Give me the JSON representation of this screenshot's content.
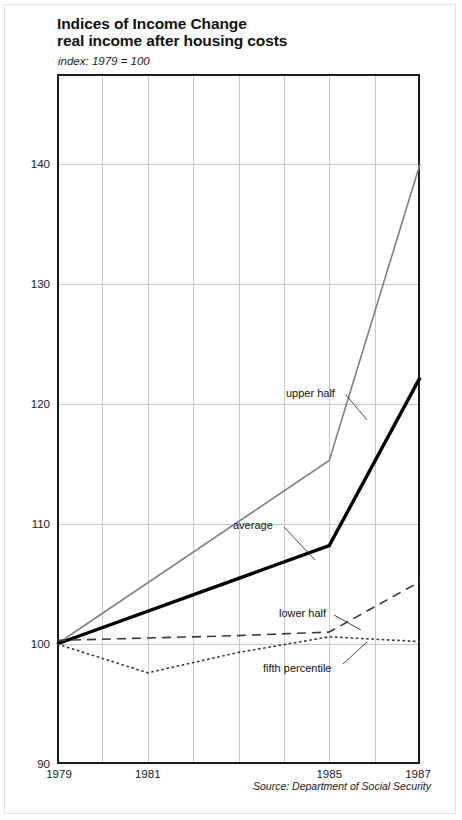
{
  "header": {
    "title_line1": "Indices of Income Change",
    "title_line2": "real income after housing costs",
    "subtitle": "index: 1979 = 100"
  },
  "footer": {
    "source": "Source: Department of Social Security"
  },
  "annotations": {
    "upper_half": "upper half",
    "average": "average",
    "lower_half": "lower half",
    "fifth_percentile": "fifth percentile"
  },
  "colors": {
    "upper_half": "#808080",
    "average": "#000000",
    "lower_half": "#3a3a3a",
    "fifth_percentile": "#3a3a3a",
    "axis": "#1c1c1c",
    "grid": "#c9c9c9",
    "background": "#ffffff"
  },
  "chart_data": {
    "type": "line",
    "subtitle": "index: 1979 = 100",
    "xlabel": "",
    "ylabel": "",
    "xlim": [
      1979,
      1987
    ],
    "ylim": [
      90,
      147.5
    ],
    "yticks": [
      90,
      100,
      110,
      120,
      130,
      140
    ],
    "ytick_labels": [
      "90",
      "100",
      "110",
      "120",
      "130",
      "140"
    ],
    "xticks": [
      1979,
      1981,
      1985,
      1987
    ],
    "xtick_labels": [
      "1979",
      "1981",
      "1985",
      "1987"
    ],
    "xgridlines": [
      1980,
      1981,
      1982,
      1983,
      1984,
      1985,
      1986
    ],
    "grid": true,
    "legend": "inline-annotations",
    "x": [
      1979,
      1981,
      1985,
      1987
    ],
    "series": [
      {
        "name": "upper half",
        "style": "solid",
        "color": "#808080",
        "width": 1.6,
        "x": [
          1979,
          1985,
          1987
        ],
        "values": [
          100.0,
          115.3,
          140.0
        ]
      },
      {
        "name": "average",
        "style": "solid",
        "color": "#000000",
        "width": 3.4,
        "x": [
          1979,
          1985,
          1987
        ],
        "values": [
          100.0,
          108.2,
          122.2
        ]
      },
      {
        "name": "lower half",
        "style": "dashed",
        "color": "#3a3a3a",
        "width": 1.6,
        "x": [
          1979,
          1981,
          1983,
          1985,
          1987
        ],
        "values": [
          100.3,
          100.5,
          100.7,
          101.0,
          105.2
        ]
      },
      {
        "name": "fifth percentile",
        "style": "dotted",
        "color": "#3a3a3a",
        "width": 1.6,
        "x": [
          1979,
          1981,
          1983,
          1985,
          1987
        ],
        "values": [
          100.0,
          97.6,
          99.3,
          100.6,
          100.2
        ]
      }
    ]
  }
}
